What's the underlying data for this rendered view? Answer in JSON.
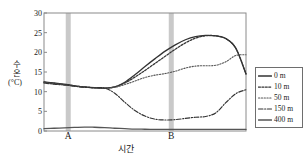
{
  "chart_data": {
    "type": "line",
    "title": "",
    "xlabel": "시간",
    "ylabel": "수온",
    "ylabel_unit": "(°C)",
    "ylim": [
      0,
      30
    ],
    "yticks": [
      0,
      5,
      10,
      15,
      20,
      25,
      30
    ],
    "xlim": [
      0,
      100
    ],
    "grid": false,
    "legend_position": "right-outside",
    "x": [
      0,
      5,
      10,
      15,
      20,
      25,
      30,
      35,
      40,
      45,
      50,
      55,
      60,
      65,
      70,
      75,
      80,
      85,
      90,
      95,
      100
    ],
    "series": [
      {
        "name": "0 m",
        "style": "solid",
        "color": "#333333",
        "values": [
          12.5,
          12.2,
          11.9,
          11.5,
          11.2,
          11.0,
          10.9,
          11.2,
          12.4,
          14.3,
          16.4,
          18.4,
          20.3,
          21.9,
          23.2,
          24.0,
          24.3,
          24.2,
          23.5,
          21.0,
          14.5
        ]
      },
      {
        "name": "10 m",
        "style": "dotted",
        "color": "#333333",
        "values": [
          12.4,
          12.1,
          11.8,
          11.5,
          11.2,
          11.0,
          10.9,
          11.2,
          12.2,
          13.7,
          15.4,
          17.2,
          19.0,
          20.8,
          22.4,
          23.6,
          24.2,
          24.2,
          23.5,
          21.0,
          14.5
        ]
      },
      {
        "name": "50 m",
        "style": "dotted-fine",
        "color": "#555555",
        "values": [
          12.3,
          12.0,
          11.7,
          11.4,
          11.2,
          11.0,
          10.9,
          11.1,
          11.8,
          12.7,
          13.6,
          14.2,
          14.6,
          15.2,
          16.0,
          16.5,
          16.6,
          16.7,
          17.6,
          19.2,
          19.4
        ]
      },
      {
        "name": "150 m",
        "style": "dashdot",
        "color": "#333333",
        "values": [
          12.2,
          11.9,
          11.7,
          11.4,
          11.1,
          11.0,
          10.9,
          9.6,
          7.3,
          5.2,
          3.8,
          3.0,
          2.8,
          2.9,
          3.2,
          3.5,
          3.7,
          4.6,
          7.2,
          9.5,
          10.5
        ]
      },
      {
        "name": "400 m",
        "style": "solid",
        "color": "#555555",
        "values": [
          0.6,
          0.7,
          0.8,
          0.9,
          1.0,
          0.95,
          0.85,
          0.7,
          0.6,
          0.5,
          0.45,
          0.4,
          0.4,
          0.4,
          0.4,
          0.4,
          0.4,
          0.4,
          0.4,
          0.4,
          0.4
        ]
      }
    ],
    "annotations": [
      {
        "label": "A",
        "x": 12,
        "type": "vertical-band",
        "band_color": "#c9c9c9"
      },
      {
        "label": "B",
        "x": 63,
        "type": "vertical-band",
        "band_color": "#c9c9c9"
      }
    ]
  },
  "legend": {
    "items": [
      {
        "label": "0 m",
        "style": "solid"
      },
      {
        "label": "10 m",
        "style": "dotted"
      },
      {
        "label": "50 m",
        "style": "dotted-fine"
      },
      {
        "label": "150 m",
        "style": "dashdot"
      },
      {
        "label": "400 m",
        "style": "solid"
      }
    ]
  }
}
